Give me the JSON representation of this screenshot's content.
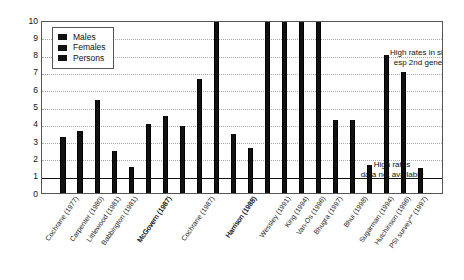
{
  "chart_data": {
    "type": "bar",
    "title": "",
    "xlabel": "",
    "ylabel": "",
    "ylim": [
      0,
      10
    ],
    "yticks": [
      0,
      1,
      2,
      3,
      4,
      5,
      6,
      7,
      8,
      9,
      10
    ],
    "grid": true,
    "reference_line": 1,
    "legend_position": "top-left",
    "legend": [
      "Males",
      "Females",
      "Persons"
    ],
    "note": "Relative risk / rate ratio of psychosis in African-Caribbean populations by study. Several bars exceed the axis maximum of 10 and are truncated at the top.",
    "categories": [
      "Cochrane (1977)",
      "Carpenter (1980)",
      "Littlewood (1981)",
      "Babbington (1981)",
      "McGovern (1987)",
      "McGovern (1987)",
      "Cochrane (1987)",
      "Harrison (1988)",
      "Harrison (1988)",
      "Wessley (1991)",
      "King (1994)",
      "Van-Os (1996)",
      "Bhugra (1997)",
      "Bhui (1998)",
      "Flannigan (1994)",
      "Callan (1996)",
      "Koffman (1997)",
      "Sashidharan (1997)",
      "Sugarman (1994)",
      "Hutchinson (1996)",
      "PSI survey** (1997)"
    ],
    "bars": [
      {
        "category": "Cochrane (1977)",
        "series": "Males",
        "value": 3.25,
        "truncated": false
      },
      {
        "category": "Cochrane (1977)",
        "series": "Females",
        "value": 3.6,
        "truncated": false
      },
      {
        "category": "Carpenter (1980)",
        "series": "Persons",
        "value": 5.4,
        "truncated": false
      },
      {
        "category": "Littlewood (1981)",
        "series": "Persons",
        "value": 2.4,
        "truncated": false
      },
      {
        "category": "Babbington (1981)",
        "series": "Persons",
        "value": 1.5,
        "truncated": false
      },
      {
        "category": "McGovern (1987)",
        "series": "Males",
        "value": 4.0,
        "truncated": false
      },
      {
        "category": "McGovern (1987)",
        "series": "Females",
        "value": 4.45,
        "truncated": false
      },
      {
        "category": "McGovern (1987)",
        "series": "Persons",
        "value": 3.85,
        "truncated": false
      },
      {
        "category": "Cochrane (1987)",
        "series": "Males",
        "value": 6.6,
        "truncated": false
      },
      {
        "category": "Cochrane (1987)",
        "series": "Females",
        "value": 10.0,
        "truncated": true
      },
      {
        "category": "Harrison (1988)",
        "series": "Males",
        "value": 3.4,
        "truncated": false
      },
      {
        "category": "Harrison (1988)",
        "series": "Females",
        "value": 2.6,
        "truncated": false
      },
      {
        "category": "Harrison (1988)",
        "series": "Persons",
        "value": 10.0,
        "truncated": true
      },
      {
        "category": "Wessley (1991)",
        "series": "Persons",
        "value": 10.0,
        "truncated": true
      },
      {
        "category": "King (1994)",
        "series": "Persons",
        "value": 10.0,
        "truncated": true
      },
      {
        "category": "Van-Os (1996)",
        "series": "Persons",
        "value": 10.0,
        "truncated": true
      },
      {
        "category": "Bhugra (1997)",
        "series": "Persons",
        "value": 4.2,
        "truncated": false
      },
      {
        "category": "Bhui (1998)",
        "series": "Persons",
        "value": 4.2,
        "truncated": false
      },
      {
        "category": "Bhui (1998)",
        "series": "Males",
        "value": 1.6,
        "truncated": false
      },
      {
        "category": "Sugarman (1994)",
        "series": "Persons",
        "value": 8.0,
        "truncated": false
      },
      {
        "category": "Hutchinson (1996)",
        "series": "Persons",
        "value": 7.0,
        "truncated": false
      },
      {
        "category": "PSI survey** (1997)",
        "series": "Persons",
        "value": 1.45,
        "truncated": false
      }
    ],
    "annotations": [
      {
        "id": "siblings",
        "text": "High rates in siblings,\nesp 2nd generation"
      },
      {
        "id": "norates",
        "text": "High rates\ndata not available"
      }
    ]
  },
  "colors": {
    "bar": "#111111",
    "axis": "#555555",
    "grid": "#a8a8a8",
    "reference_line": "#111111",
    "background": "#ffffff",
    "text": "#1a1a1a"
  }
}
